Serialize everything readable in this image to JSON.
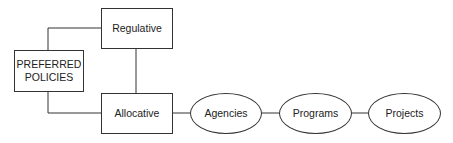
{
  "diagram": {
    "nodes": {
      "preferred": {
        "label_line1": "PREFERRED",
        "label_line2": "POLICIES",
        "shape": "rectangle"
      },
      "regulative": {
        "label": "Regulative",
        "shape": "rectangle"
      },
      "allocative": {
        "label": "Allocative",
        "shape": "rectangle"
      },
      "agencies": {
        "label": "Agencies",
        "shape": "ellipse"
      },
      "programs": {
        "label": "Programs",
        "shape": "ellipse"
      },
      "projects": {
        "label": "Projects",
        "shape": "ellipse"
      }
    },
    "edges": [
      {
        "from": "preferred",
        "to": "regulative"
      },
      {
        "from": "preferred",
        "to": "allocative"
      },
      {
        "from": "regulative",
        "to": "allocative"
      },
      {
        "from": "allocative",
        "to": "agencies"
      },
      {
        "from": "agencies",
        "to": "programs"
      },
      {
        "from": "programs",
        "to": "projects"
      }
    ],
    "colors": {
      "line": "#333333",
      "text": "#222222",
      "background": "#ffffff"
    }
  }
}
